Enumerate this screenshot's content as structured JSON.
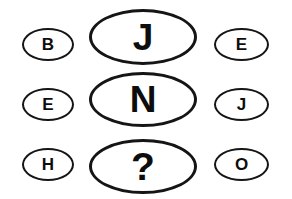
{
  "puzzle": {
    "background_color": "#ffffff",
    "stroke_color": "#151515",
    "glyph_color": "#0d0d0d",
    "rows": [
      {
        "left": {
          "label": "B",
          "shape": "oval",
          "size": "small",
          "is_answer_slot": false
        },
        "center": {
          "label": "J",
          "shape": "oval",
          "size": "large",
          "is_answer_slot": false
        },
        "right": {
          "label": "E",
          "shape": "oval",
          "size": "small",
          "is_answer_slot": false
        }
      },
      {
        "left": {
          "label": "E",
          "shape": "oval",
          "size": "small",
          "is_answer_slot": false
        },
        "center": {
          "label": "N",
          "shape": "oval",
          "size": "large",
          "is_answer_slot": false
        },
        "right": {
          "label": "J",
          "shape": "oval",
          "size": "small",
          "is_answer_slot": false
        }
      },
      {
        "left": {
          "label": "H",
          "shape": "oval",
          "size": "small",
          "is_answer_slot": false
        },
        "center": {
          "label": "?",
          "shape": "oval",
          "size": "large",
          "is_answer_slot": true
        },
        "right": {
          "label": "O",
          "shape": "oval",
          "size": "small",
          "is_answer_slot": false
        }
      }
    ]
  }
}
